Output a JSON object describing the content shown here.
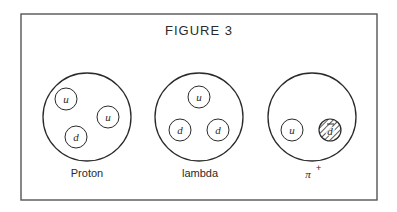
{
  "figure": {
    "title": "FIGURE 3",
    "frame": {
      "x": 21,
      "y": 14,
      "w": 356,
      "h": 186
    },
    "particles": [
      {
        "name": "proton",
        "label": "Proton",
        "cx": 87,
        "cy": 117,
        "r": 44,
        "quarks": [
          {
            "symbol": "u",
            "cx": 66,
            "cy": 99,
            "antiparticle": false
          },
          {
            "symbol": "u",
            "cx": 108,
            "cy": 117,
            "antiparticle": false
          },
          {
            "symbol": "d",
            "cx": 76,
            "cy": 137,
            "antiparticle": false
          }
        ]
      },
      {
        "name": "lambda",
        "label": "lambda",
        "cx": 199,
        "cy": 117,
        "r": 44,
        "quarks": [
          {
            "symbol": "u",
            "cx": 199,
            "cy": 97,
            "antiparticle": false
          },
          {
            "symbol": "d",
            "cx": 180,
            "cy": 130,
            "antiparticle": false
          },
          {
            "symbol": "d",
            "cx": 218,
            "cy": 130,
            "antiparticle": false
          }
        ]
      },
      {
        "name": "pi-plus",
        "label": "π",
        "label_superscript": "+",
        "cx": 312,
        "cy": 117,
        "r": 44,
        "quarks": [
          {
            "symbol": "u",
            "cx": 292,
            "cy": 130,
            "antiparticle": false
          },
          {
            "symbol": "d",
            "cx": 330,
            "cy": 130,
            "antiparticle": true
          }
        ]
      }
    ],
    "quark_radius": 11,
    "colors": {
      "stroke": "#2a2a2a",
      "background": "#ffffff",
      "frame": "#555555"
    }
  }
}
